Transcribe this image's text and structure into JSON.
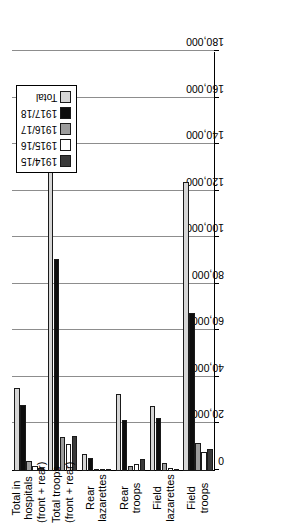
{
  "chart_data": {
    "type": "bar",
    "orientation": "horizontal-rotated",
    "title": "",
    "xlabel": "",
    "ylabel": "",
    "categories": [
      "Field troops",
      "Field lazarettes",
      "Rear troops",
      "Rear lazarettes",
      "Total troops (front + rear)",
      "Total in hospitals (front + rear)"
    ],
    "category_lines": [
      [
        "Field",
        "troops"
      ],
      [
        "Field",
        "lazarettes"
      ],
      [
        "Rear",
        "troops"
      ],
      [
        "Rear",
        "lazarettes"
      ],
      [
        "Total troops",
        "(front + rear)"
      ],
      [
        "Total in",
        "hospitals",
        "(front + rear)"
      ]
    ],
    "series": [
      {
        "name": "1914/15",
        "color": "#3a3a3a",
        "values": [
          9500,
          700,
          5200,
          300,
          15000,
          1100
        ]
      },
      {
        "name": "1915/16",
        "color": "#ffffff",
        "values": [
          8200,
          1500,
          3100,
          500,
          11800,
          2100
        ]
      },
      {
        "name": "1916/17",
        "color": "#9c9c9c",
        "values": [
          12000,
          3400,
          2300,
          900,
          14500,
          4300
        ]
      },
      {
        "name": "1917/18",
        "color": "#0d0d0d",
        "values": [
          68000,
          22800,
          22000,
          5400,
          91000,
          28200
        ]
      },
      {
        "name": "Total",
        "color": "#d6d6d6",
        "values": [
          124000,
          28000,
          33000,
          7100,
          155000,
          35500
        ]
      }
    ],
    "ticks": [
      0,
      20000,
      40000,
      60000,
      80000,
      100000,
      120000,
      140000,
      160000,
      180000
    ],
    "tick_labels": [
      "0",
      "20,000",
      "40,000",
      "60,000",
      "80,000",
      "100,000",
      "120,000",
      "140,000",
      "160,000",
      "180,000"
    ],
    "xlim": [
      0,
      180000
    ],
    "grid": true,
    "legend_position": "top-left",
    "legend_entries": [
      "1914/15",
      "1915/16",
      "1916/17",
      "1917/18",
      "Total"
    ]
  }
}
